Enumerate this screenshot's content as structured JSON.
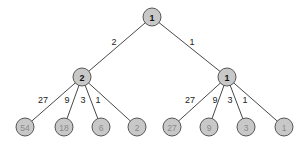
{
  "colors": {
    "node_fill": "#c8c8c8",
    "node_stroke": "#555555",
    "edge": "#333333",
    "internal_text": "#111111",
    "leaf_text": "#8a8a8a",
    "edge_label": "#222222"
  },
  "tree": {
    "root": {
      "label": "1",
      "children": [
        {
          "edge_label": "2",
          "label": "2",
          "children": [
            {
              "edge_label": "27",
              "label": "54"
            },
            {
              "edge_label": "9",
              "label": "18"
            },
            {
              "edge_label": "3",
              "label": "6"
            },
            {
              "edge_label": "1",
              "label": "2"
            }
          ]
        },
        {
          "edge_label": "1",
          "label": "1",
          "children": [
            {
              "edge_label": "27",
              "label": "27"
            },
            {
              "edge_label": "9",
              "label": "9"
            },
            {
              "edge_label": "3",
              "label": "3"
            },
            {
              "edge_label": "1",
              "label": "1"
            }
          ]
        }
      ]
    }
  }
}
